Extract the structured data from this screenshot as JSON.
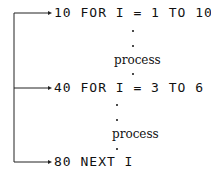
{
  "lines": [
    {
      "text": "10 FOR I = 1 TO 10"
    },
    {
      "text": "40 FOR I = 3 TO 6"
    },
    {
      "text": "80 NEXT I"
    }
  ],
  "process_label": "process"
}
